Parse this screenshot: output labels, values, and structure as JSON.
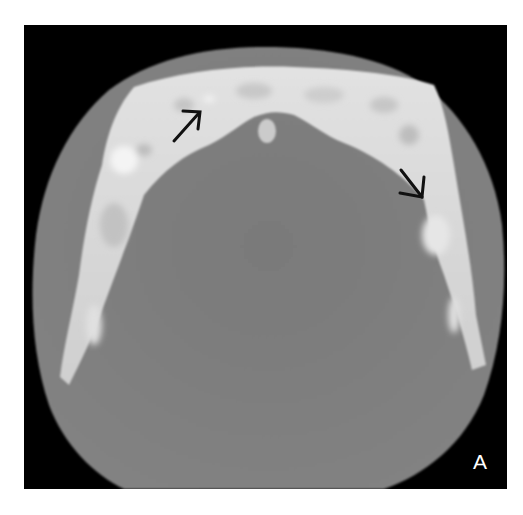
{
  "figure": {
    "panel_label": "A",
    "annotations": [
      {
        "type": "arrow",
        "direction": "up-right",
        "position": "anterior-left mandible"
      },
      {
        "type": "arrow",
        "direction": "down-right",
        "position": "right mandibular body"
      }
    ],
    "colors": {
      "background": "#000000",
      "soft_tissue": "#7d7d7d",
      "bone": "#d8d8d8",
      "arrow": "#111111",
      "label": "#ffffff",
      "page": "#ffffff"
    }
  }
}
